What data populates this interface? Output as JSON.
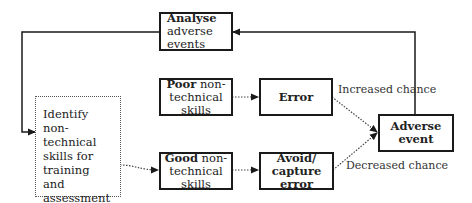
{
  "nodes": {
    "analyse": {
      "bold": "Analyse",
      "rest": "adverse events"
    },
    "identify": {
      "text": "Identify non-technical skills for training and assessment"
    },
    "poor": {
      "bold": "Poor",
      "rest": " non-technical skills"
    },
    "good": {
      "bold": "Good",
      "rest": " non-technical skills"
    },
    "error": {
      "bold": "Error"
    },
    "avoid": {
      "bold": "Avoid/ capture error"
    },
    "adverse": {
      "bold": "Adverse event"
    }
  },
  "edge_labels": {
    "increased": "Increased chance",
    "decreased": "Decreased chance"
  },
  "colors": {
    "line": "#1a1a1a",
    "dotted": "#444444"
  }
}
